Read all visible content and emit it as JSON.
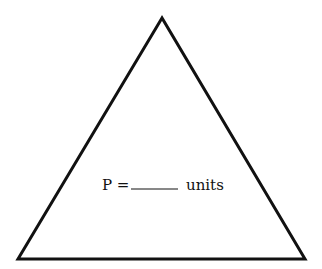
{
  "diagram": {
    "shape": "triangle",
    "vertices": [
      [
        162,
        18
      ],
      [
        18,
        259
      ],
      [
        305,
        259
      ]
    ],
    "stroke_color": "#111111",
    "fill_color": "#ffffff",
    "label": {
      "prefix": "P =",
      "blank": "______",
      "suffix": "units"
    }
  }
}
